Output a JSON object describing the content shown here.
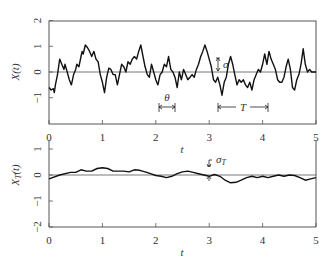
{
  "chart_data": [
    {
      "type": "line",
      "panel": "top",
      "title": "",
      "xlabel": "t",
      "ylabel": "X(t)",
      "xlim": [
        0,
        5
      ],
      "ylim": [
        -2,
        2
      ],
      "xticks": [
        0,
        1,
        2,
        3,
        4,
        5
      ],
      "yticks": [
        -1,
        0,
        1,
        2
      ],
      "ytick_labels": [
        "−1",
        "0",
        "1",
        "2"
      ],
      "grid": false,
      "reference_line_y": 0,
      "annotations": [
        {
          "label": "σ",
          "type": "double-arrow vertical",
          "x": 2.95,
          "y_from": 0,
          "y_to": 0.65
        },
        {
          "label": "θ",
          "type": "span",
          "x_from": 2.05,
          "x_to": 2.35,
          "y": -1.4
        },
        {
          "label": "T",
          "type": "span",
          "x_from": 3.05,
          "x_to": 4.1,
          "y": -1.4
        }
      ],
      "series": [
        {
          "name": "X(t)",
          "x": [
            0.0,
            0.04,
            0.08,
            0.1,
            0.12,
            0.16,
            0.2,
            0.24,
            0.28,
            0.3,
            0.34,
            0.38,
            0.42,
            0.46,
            0.5,
            0.52,
            0.56,
            0.6,
            0.62,
            0.64,
            0.68,
            0.72,
            0.76,
            0.8,
            0.84,
            0.88,
            0.92,
            0.96,
            1.0,
            1.04,
            1.08,
            1.12,
            1.16,
            1.2,
            1.24,
            1.28,
            1.32,
            1.36,
            1.4,
            1.44,
            1.48,
            1.52,
            1.56,
            1.6,
            1.64,
            1.68,
            1.72,
            1.76,
            1.8,
            1.84,
            1.88,
            1.92,
            1.96,
            2.0,
            2.04,
            2.08,
            2.12,
            2.16,
            2.2,
            2.24,
            2.28,
            2.32,
            2.36,
            2.4,
            2.44,
            2.48,
            2.52,
            2.56,
            2.6,
            2.64,
            2.68,
            2.72,
            2.76,
            2.8,
            2.84,
            2.88,
            2.92,
            2.96,
            3.0,
            3.04,
            3.08,
            3.12,
            3.16,
            3.2,
            3.24,
            3.28,
            3.32,
            3.36,
            3.4,
            3.44,
            3.48,
            3.52,
            3.56,
            3.6,
            3.64,
            3.68,
            3.72,
            3.76,
            3.8,
            3.84,
            3.88,
            3.92,
            3.96,
            4.0,
            4.04,
            4.08,
            4.12,
            4.16,
            4.2,
            4.24,
            4.28,
            4.32,
            4.36,
            4.4,
            4.44,
            4.48,
            4.52,
            4.56,
            4.6,
            4.64,
            4.68,
            4.72,
            4.76,
            4.8,
            4.84,
            4.88,
            4.92,
            4.96,
            5.0
          ],
          "values": [
            -0.6,
            -0.7,
            -0.65,
            -0.8,
            -0.5,
            -0.1,
            0.5,
            0.3,
            0.1,
            0.3,
            0.0,
            -0.3,
            -0.5,
            -0.1,
            0.1,
            0.3,
            0.2,
            0.6,
            0.8,
            0.7,
            1.05,
            0.95,
            0.8,
            0.6,
            0.8,
            0.5,
            0.4,
            -0.1,
            -0.4,
            -0.8,
            -0.2,
            0.15,
            0.1,
            -0.1,
            -0.1,
            -0.5,
            -0.1,
            0.3,
            0.2,
            0.0,
            0.4,
            0.3,
            0.5,
            0.6,
            0.5,
            0.8,
            1.05,
            0.6,
            0.2,
            -0.1,
            -0.2,
            0.3,
            0.0,
            -0.3,
            -0.5,
            -0.1,
            0.0,
            0.3,
            0.2,
            0.6,
            0.1,
            0.0,
            -0.2,
            -0.6,
            0.0,
            -0.3,
            0.1,
            -0.1,
            -0.3,
            -0.2,
            -0.1,
            -0.2,
            0.1,
            0.3,
            0.6,
            0.8,
            1.05,
            0.8,
            0.5,
            0.2,
            -0.3,
            -0.4,
            -0.2,
            -0.5,
            -0.9,
            -0.4,
            -0.2,
            0.3,
            0.6,
            0.3,
            -0.1,
            -0.5,
            -0.3,
            -0.4,
            -0.3,
            -0.5,
            -0.6,
            -0.4,
            -0.7,
            -0.3,
            -0.1,
            0.1,
            0.0,
            0.3,
            0.7,
            0.3,
            0.8,
            0.5,
            0.3,
            0.1,
            -0.3,
            -0.4,
            -0.4,
            -0.2,
            0.2,
            0.5,
            0.1,
            -0.6,
            -0.7,
            -0.3,
            -0.1,
            0.3,
            0.9,
            0.3,
            0.0,
            0.1,
            0.0,
            0.0,
            0.0
          ]
        }
      ]
    },
    {
      "type": "line",
      "panel": "bottom",
      "title": "",
      "xlabel": "t",
      "ylabel": "X_T(t)",
      "xlim": [
        0,
        5
      ],
      "ylim": [
        -2,
        1.5
      ],
      "xticks": [
        0,
        1,
        2,
        3,
        4,
        5
      ],
      "yticks": [
        -2,
        -1,
        0,
        1
      ],
      "ytick_labels": [
        "−2",
        "−1",
        "0",
        "1"
      ],
      "grid": false,
      "reference_line_y": 0,
      "annotations": [
        {
          "label": "σ_T",
          "type": "double-arrow vertical",
          "x": 3.0,
          "y_from": -0.1,
          "y_to": 0.15
        }
      ],
      "series": [
        {
          "name": "X_T(t)",
          "x": [
            0.0,
            0.2,
            0.4,
            0.5,
            0.6,
            0.7,
            0.8,
            0.9,
            1.0,
            1.1,
            1.2,
            1.3,
            1.4,
            1.5,
            1.6,
            1.7,
            1.8,
            1.9,
            2.0,
            2.1,
            2.2,
            2.3,
            2.4,
            2.5,
            2.6,
            2.7,
            2.8,
            2.9,
            3.0,
            3.1,
            3.2,
            3.3,
            3.4,
            3.5,
            3.6,
            3.7,
            3.8,
            3.9,
            4.0,
            4.1,
            4.2,
            4.3,
            4.4,
            4.5,
            4.6,
            4.7,
            4.8,
            4.9,
            5.0
          ],
          "values": [
            -0.15,
            0.0,
            0.1,
            0.1,
            0.2,
            0.15,
            0.15,
            0.25,
            0.28,
            0.25,
            0.15,
            0.15,
            0.15,
            0.12,
            0.2,
            0.18,
            0.12,
            0.05,
            -0.02,
            -0.05,
            -0.1,
            -0.05,
            0.05,
            0.12,
            0.15,
            0.1,
            0.05,
            0.0,
            -0.05,
            0.02,
            -0.05,
            -0.2,
            -0.3,
            -0.28,
            -0.2,
            -0.1,
            -0.05,
            -0.1,
            -0.05,
            -0.1,
            -0.05,
            0.0,
            -0.05,
            0.0,
            -0.02,
            -0.1,
            -0.2,
            -0.15,
            -0.1
          ]
        }
      ]
    }
  ],
  "labels": {
    "top_ylabel": "X(t)",
    "bottom_ylabel_main": "X",
    "bottom_ylabel_sub": "T",
    "bottom_ylabel_arg": "(t)",
    "xlabel": "t",
    "sigma": "σ",
    "theta": "θ",
    "T": "T",
    "sigma_T_main": "σ",
    "sigma_T_sub": "T",
    "xticks": [
      "0",
      "1",
      "2",
      "3",
      "4",
      "5"
    ],
    "top_yticks": [
      "−1",
      "0",
      "1",
      "2"
    ],
    "bottom_yticks": [
      "−2",
      "−1",
      "0",
      "1"
    ]
  },
  "colors": {
    "line": "#111111",
    "axis": "#555555",
    "text": "#333333"
  }
}
